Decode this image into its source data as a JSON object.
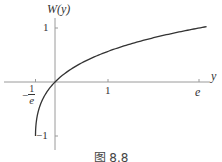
{
  "chart_data": {
    "type": "line",
    "title": "",
    "function": "W(y) (Lambert W, principal branch)",
    "xlabel": "y",
    "ylabel": "W(y)",
    "x_ticks": [
      {
        "value": -0.3679,
        "label_minus": "−",
        "label_num": "1",
        "label_den": "e"
      },
      {
        "value": 1,
        "label": "1"
      },
      {
        "value": 2.7183,
        "label": "e"
      }
    ],
    "y_ticks": [
      {
        "value": 1,
        "label": "1"
      },
      {
        "value": -1,
        "label": "−1"
      }
    ],
    "xlim": [
      -1.0,
      3.0
    ],
    "ylim": [
      -1.2,
      1.4
    ],
    "grid": false,
    "legend": null,
    "series": [
      {
        "name": "W(y)",
        "x": [
          -0.3679,
          -0.35,
          -0.3,
          -0.2,
          -0.1,
          0,
          0.25,
          0.5,
          1.0,
          1.5,
          2.0,
          2.7183,
          2.9
        ],
        "y": [
          -1.0,
          -0.72,
          -0.49,
          -0.26,
          -0.11,
          0,
          0.2,
          0.35,
          0.567,
          0.726,
          0.853,
          1.0,
          1.03
        ]
      }
    ],
    "caption": "图 8.8"
  },
  "labels": {
    "ylabel_main": "W",
    "ylabel_arg": "(y)",
    "xlabel": "y",
    "ytick_pos": "1",
    "ytick_neg": "−1",
    "xtick_one": "1",
    "xtick_e": "e",
    "xtick_inv_minus": "−",
    "xtick_inv_num": "1",
    "xtick_inv_den": "e",
    "caption": "图 8.8"
  }
}
